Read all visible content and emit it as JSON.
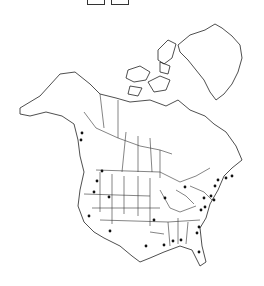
{
  "map": {
    "title": "",
    "region": "North America",
    "colors": {
      "land": "#ffffff",
      "outline": "#222222",
      "dot": "#111111",
      "background": "#ffffff"
    },
    "top_controls": [
      {
        "name": "left-box"
      },
      {
        "name": "right-box"
      }
    ],
    "occurrence_points": [
      {
        "x": 102,
        "y": 171
      },
      {
        "x": 97,
        "y": 181
      },
      {
        "x": 94,
        "y": 192
      },
      {
        "x": 109,
        "y": 197
      },
      {
        "x": 89,
        "y": 216
      },
      {
        "x": 110,
        "y": 231
      },
      {
        "x": 146,
        "y": 246
      },
      {
        "x": 185,
        "y": 187
      },
      {
        "x": 165,
        "y": 198
      },
      {
        "x": 154,
        "y": 220
      },
      {
        "x": 204,
        "y": 198
      },
      {
        "x": 201,
        "y": 210
      },
      {
        "x": 199,
        "y": 227
      },
      {
        "x": 197,
        "y": 233
      },
      {
        "x": 218,
        "y": 180
      },
      {
        "x": 226,
        "y": 178
      },
      {
        "x": 232,
        "y": 176
      },
      {
        "x": 215,
        "y": 186
      },
      {
        "x": 211,
        "y": 196
      },
      {
        "x": 214,
        "y": 200
      },
      {
        "x": 205,
        "y": 207
      },
      {
        "x": 164,
        "y": 245
      },
      {
        "x": 173,
        "y": 241
      },
      {
        "x": 181,
        "y": 240
      },
      {
        "x": 199,
        "y": 252
      },
      {
        "x": 82,
        "y": 133
      },
      {
        "x": 81,
        "y": 140
      }
    ]
  }
}
